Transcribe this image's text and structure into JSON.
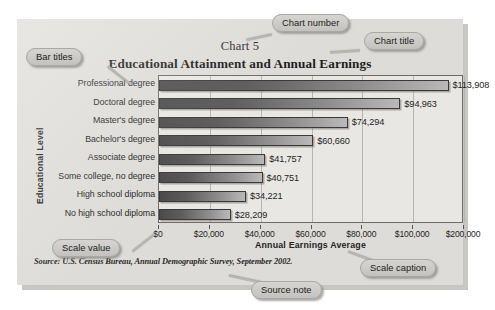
{
  "chart_data": {
    "type": "bar",
    "orientation": "horizontal",
    "chart_number": "Chart 5",
    "title": "Educational Attainment and Annual Earnings",
    "xlabel": "Annual Earnings Average",
    "ylabel": "Educational Level",
    "source": "Source: U.S. Census Bureau, Annual Demographic Survey, September 2002.",
    "categories": [
      "Professional degree",
      "Doctoral degree",
      "Master's degree",
      "Bachelor's degree",
      "Associate degree",
      "Some college, no degree",
      "High school diploma",
      "No high school diploma"
    ],
    "values": [
      113908,
      94963,
      74294,
      60660,
      41757,
      40751,
      34221,
      28209
    ],
    "value_labels": [
      "$113,908",
      "$94,963",
      "$74,294",
      "$60,660",
      "$41,757",
      "$40,751",
      "$34,221",
      "$28,209"
    ],
    "xtick_labels": [
      "$0",
      "$20,000",
      "$40,000",
      "$60,000",
      "$80,000",
      "$100,000",
      "$200,000"
    ],
    "xtick_values": [
      0,
      20000,
      40000,
      60000,
      80000,
      100000,
      120000
    ],
    "xlim": [
      0,
      120000
    ],
    "grid": true,
    "legend": "none",
    "bar_color_dark": "#4b4b4b",
    "bar_color_light": "#b9b9b9",
    "plot_background": "#e9e7e3",
    "card_background": "#dedcd8"
  },
  "callouts": {
    "bar_titles": "Bar titles",
    "chart_number": "Chart number",
    "chart_title": "Chart title",
    "scale_value": "Scale value",
    "scale_caption": "Scale caption",
    "source_note": "Source note"
  }
}
